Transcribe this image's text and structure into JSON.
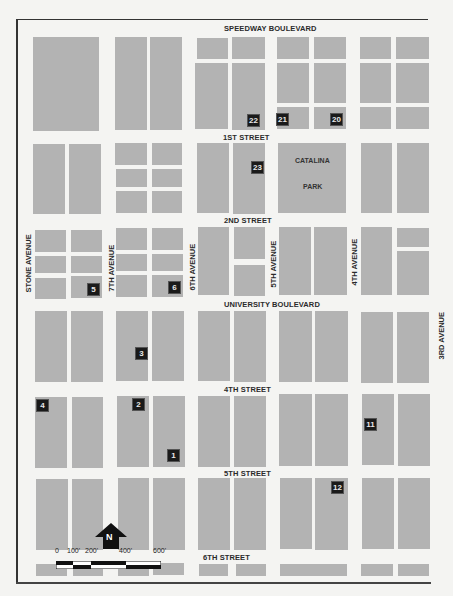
{
  "map": {
    "frame_color": "#333333",
    "block_color": "#b3b3b3",
    "marker_color": "#1a1a1a",
    "streets": {
      "speedway": "SPEEDWAY BOULEVARD",
      "first": "1ST STREET",
      "second": "2ND STREET",
      "university": "UNIVERSITY BOULEVARD",
      "fourth": "4TH STREET",
      "fifth": "5TH STREET",
      "sixth": "6TH STREET"
    },
    "avenues": {
      "stone": "STONE AVENUE",
      "seventh": "7TH AVENUE",
      "sixth": "6TH AVENUE",
      "fifth": "5TH AVENUE",
      "fourth": "4TH AVENUE",
      "third": "3RD AVENUE"
    },
    "park": {
      "line1": "CATALINA",
      "line2": "PARK"
    },
    "markers": [
      "1",
      "2",
      "3",
      "4",
      "5",
      "6",
      "11",
      "12",
      "20",
      "21",
      "22",
      "23"
    ],
    "north_arrow": "N",
    "scale": {
      "ticks": [
        "0",
        "100'",
        "200'",
        "400'",
        "600'"
      ]
    }
  }
}
